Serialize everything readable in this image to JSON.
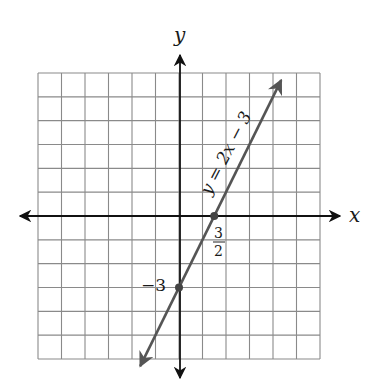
{
  "chart_data": {
    "type": "line",
    "title": "",
    "xlabel": "x",
    "ylabel": "y",
    "xlim": [
      -6,
      6
    ],
    "ylim": [
      -6,
      6
    ],
    "grid": true,
    "grid_step": 1,
    "series": [
      {
        "name": "y = 2x − 3",
        "equation": "y = 2x − 3",
        "slope": 2,
        "intercept": -3,
        "x": [
          -1.5,
          0,
          1.5,
          4.5
        ],
        "y": [
          -6,
          -3,
          0,
          6
        ],
        "arrows_both_ends": true
      }
    ],
    "points": [
      {
        "name": "y-intercept",
        "x": 0,
        "y": -3,
        "label": "−3"
      },
      {
        "name": "x-intercept",
        "x": 1.5,
        "y": 0,
        "label_numerator": "3",
        "label_denominator": "2"
      }
    ],
    "annotations": [
      {
        "text": "y = 2x − 3",
        "position": "along line, rotated"
      }
    ]
  },
  "labels": {
    "x_axis": "x",
    "y_axis": "y",
    "line_label": "y = 2x − 3",
    "y_intercept": "−3",
    "x_intercept_num": "3",
    "x_intercept_den": "2"
  },
  "colors": {
    "grid": "#8a8a8a",
    "axes": "#111111",
    "line": "#555555",
    "points": "#444444"
  }
}
